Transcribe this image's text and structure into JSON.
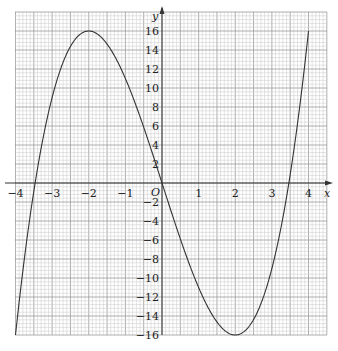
{
  "chart_data": {
    "type": "line",
    "title": "",
    "xlabel": "x",
    "ylabel": "y",
    "origin_label": "O",
    "xlim": [
      -4,
      4
    ],
    "ylim": [
      -16,
      16
    ],
    "grid": true,
    "legend": null,
    "x_ticks": [
      -4,
      -3,
      -2,
      -1,
      1,
      2,
      3,
      4
    ],
    "x_tick_labels": [
      "−4",
      "−3",
      "−2",
      "−1",
      "1",
      "2",
      "3",
      "4"
    ],
    "y_ticks": [
      16,
      14,
      12,
      10,
      8,
      6,
      4,
      2,
      -2,
      -4,
      -6,
      -8,
      -10,
      -12,
      -14,
      -16
    ],
    "y_tick_labels": [
      "16",
      "14",
      "12",
      "10",
      "8",
      "6",
      "4",
      "2",
      "−2",
      "−4",
      "−6",
      "−8",
      "−10",
      "−12",
      "−14",
      "−16"
    ],
    "series": [
      {
        "name": "y = x^3 - 12x",
        "x": [
          -4,
          -3.5,
          -3,
          -2.5,
          -2,
          -1.5,
          -1,
          -0.5,
          0,
          0.5,
          1,
          1.5,
          2,
          2.5,
          3,
          3.5,
          4
        ],
        "y": [
          -16,
          -0.875,
          9,
          14.375,
          16,
          14.625,
          11,
          5.875,
          0,
          -5.875,
          -11,
          -14.625,
          -16,
          -14.375,
          -9,
          0.875,
          16
        ]
      }
    ],
    "annotations": {
      "local_max": [
        -2,
        16
      ],
      "local_min": [
        2,
        -16
      ]
    }
  },
  "plot": {
    "px_left": 16,
    "px_right": 309,
    "px_origin_x": 162,
    "px_top_y16": 31,
    "px_origin_y": 183,
    "grid_left": 15,
    "grid_right": 327,
    "grid_top": 12,
    "grid_bottom": 335,
    "colors": {
      "minor_grid": "#c8c8c8",
      "major_grid": "#9a9a9a",
      "axis": "#333333",
      "curve": "#333333"
    }
  }
}
